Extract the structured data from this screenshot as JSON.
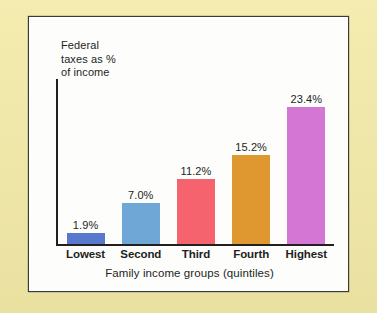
{
  "figure": {
    "panel_background": "#fdfdfb",
    "page_background": "#f3eaa7",
    "border_color": "#3a3a38"
  },
  "chart_data": {
    "type": "bar",
    "title": "",
    "ylabel": "Federal\ntaxes as %\nof income",
    "xlabel": "Family income groups (quintiles)",
    "categories": [
      "Lowest",
      "Second",
      "Third",
      "Fourth",
      "Highest"
    ],
    "values": [
      1.9,
      7.0,
      11.2,
      15.2,
      23.4
    ],
    "value_labels": [
      "1.9%",
      "7.0%",
      "11.2%",
      "15.2%",
      "23.4%"
    ],
    "bar_colors": [
      "#5878ce",
      "#6fa8d6",
      "#f4636e",
      "#df972f",
      "#d476d4"
    ],
    "ylim": [
      0,
      26
    ],
    "grid": false,
    "legend": false,
    "axis_color": "#231f1e"
  }
}
